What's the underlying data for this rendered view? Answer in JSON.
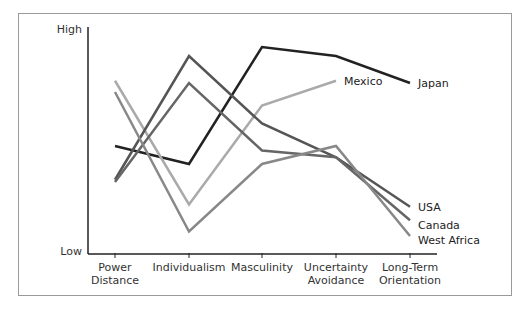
{
  "chart_data": {
    "type": "line",
    "title": "",
    "xlabel": "",
    "ylabel": "",
    "y_tick_labels": {
      "high": "High",
      "low": "Low"
    },
    "ylim": [
      0,
      100
    ],
    "grid": false,
    "legend_position": "inline-end-labels",
    "categories": [
      [
        "Power",
        "Distance"
      ],
      [
        "Individualism"
      ],
      [
        "Masculinity"
      ],
      [
        "Uncertainty",
        "Avoidance"
      ],
      [
        "Long-Term",
        "Orientation"
      ]
    ],
    "series": [
      {
        "name": "Japan",
        "color": "#222222",
        "values": [
          48,
          40,
          92,
          88,
          76
        ]
      },
      {
        "name": "Mexico",
        "color": "#aaaaaa",
        "values": [
          77,
          22,
          66,
          77,
          null
        ]
      },
      {
        "name": "USA",
        "color": "#555555",
        "values": [
          33,
          88,
          58,
          43,
          21
        ]
      },
      {
        "name": "Canada",
        "color": "#666666",
        "values": [
          32,
          76,
          46,
          43,
          15
        ]
      },
      {
        "name": "West Africa",
        "color": "#888888",
        "values": [
          72,
          10,
          40,
          48,
          8
        ]
      }
    ]
  }
}
